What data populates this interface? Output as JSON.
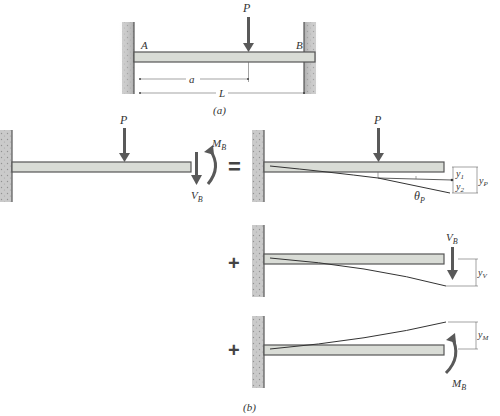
{
  "colors": {
    "beam_fill": "#d9dcd6",
    "beam_stroke": "#555555",
    "wall": "#8a8a8a",
    "arrow": "#595959",
    "line": "#444444",
    "text": "#333333"
  },
  "figure_a": {
    "load_label": "P",
    "support_left_label": "A",
    "support_right_label": "B",
    "dim_a_label": "a",
    "dim_L_label": "L",
    "caption": "(a)"
  },
  "figure_b": {
    "caption": "(b)",
    "original": {
      "load_label": "P",
      "shear_label": "V",
      "shear_sub": "B",
      "moment_label": "M",
      "moment_sub": "B",
      "equals": "="
    },
    "case_p": {
      "load_label": "P",
      "y1_label": "y",
      "y1_sub": "1",
      "y2_label": "y",
      "y2_sub": "2",
      "yp_label": "y",
      "yp_sub": "P",
      "theta_label": "θ",
      "theta_sub": "P"
    },
    "case_v": {
      "plus": "+",
      "shear_label": "V",
      "shear_sub": "B",
      "yv_label": "y",
      "yv_sub": "V"
    },
    "case_m": {
      "plus": "+",
      "moment_label": "M",
      "moment_sub": "B",
      "ym_label": "y",
      "ym_sub": "M"
    }
  }
}
